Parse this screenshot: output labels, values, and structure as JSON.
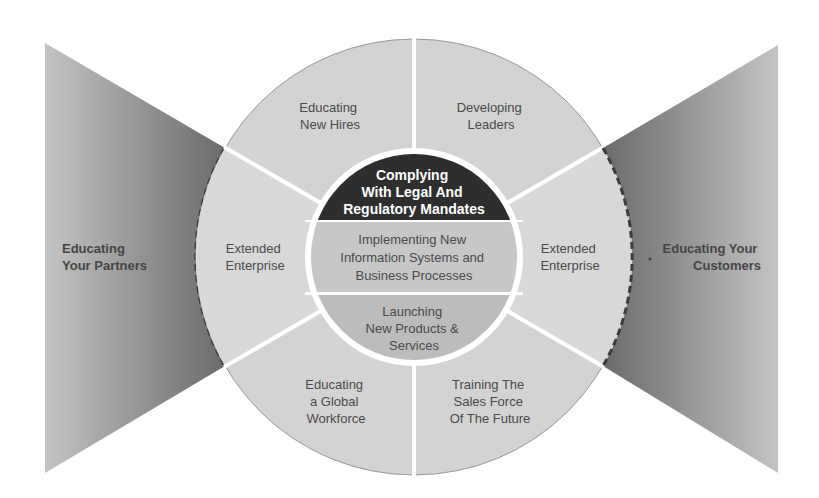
{
  "diagram": {
    "type": "segmented-wheel-with-side-wings",
    "colors": {
      "background": "#ffffff",
      "segment_fill": "#d3d3d3",
      "segment_border": "#9a9a9a",
      "divider": "#ffffff",
      "core_dark": "#2e2e2e",
      "core_mid": "#c6c6c6",
      "core_low": "#bdbdbd",
      "wing_light": "#c2c2c2",
      "wing_dark": "#6e6e6e",
      "dashed_border": "#3c3c3c",
      "text": "#4a4a4a"
    },
    "outer_segments": [
      {
        "position": "top-left",
        "lines": [
          "Educating",
          "New Hires"
        ]
      },
      {
        "position": "top-right",
        "lines": [
          "Developing",
          "Leaders"
        ]
      },
      {
        "position": "right",
        "lines": [
          "Extended",
          "Enterprise"
        ]
      },
      {
        "position": "bottom-right",
        "lines": [
          "Training The",
          "Sales Force",
          "Of The Future"
        ]
      },
      {
        "position": "bottom-left",
        "lines": [
          "Educating",
          "a Global",
          "Workforce"
        ]
      },
      {
        "position": "left",
        "lines": [
          "Extended",
          "Enterprise"
        ]
      }
    ],
    "core_bands": [
      {
        "position": "top",
        "style": "dark",
        "lines": [
          "Complying",
          "With Legal And",
          "Regulatory Mandates"
        ]
      },
      {
        "position": "middle",
        "style": "mid",
        "lines": [
          "Implementing New",
          "Information Systems and",
          "Business Processes"
        ]
      },
      {
        "position": "bottom",
        "style": "low",
        "lines": [
          "Launching",
          "New Products &",
          "Services"
        ]
      }
    ],
    "wings": [
      {
        "side": "left",
        "lines": [
          "Educating",
          "Your Partners"
        ]
      },
      {
        "side": "right",
        "lines": [
          "Educating Your",
          "Customers"
        ]
      }
    ]
  }
}
